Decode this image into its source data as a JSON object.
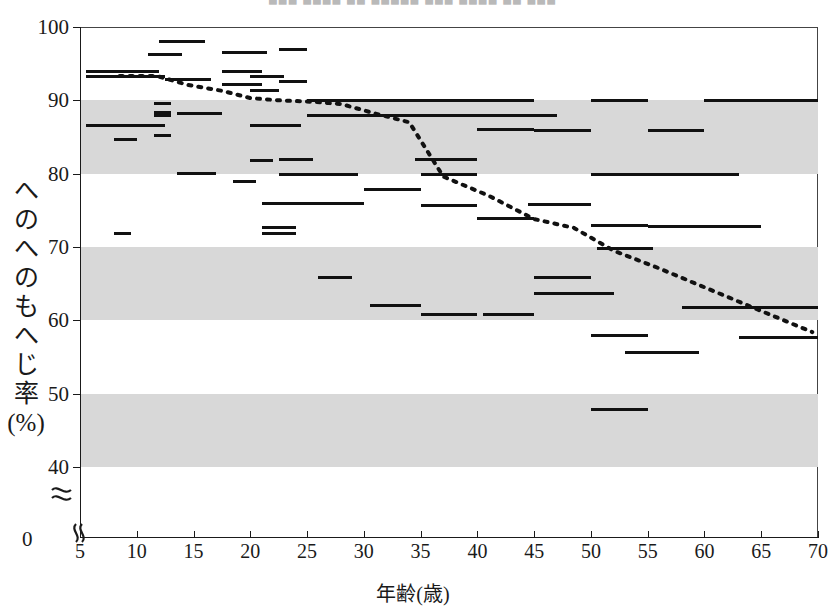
{
  "figure": {
    "top_caption": "▀▀▀  ▀▀▀▀  ▀▀  ▀▀▀▀▀  ▀▀▀  ▀▀▀▀  ▀▀  ▀▀▀",
    "x_axis_title": "年齢(歳)",
    "y_axis_title_lines": [
      "へ",
      "の",
      "へ",
      "の",
      "も",
      "へ",
      "じ",
      "率",
      "(%)"
    ],
    "zero_label": "0",
    "accent_color": "#111111",
    "band_color": "#d8d8d8",
    "axis_color": "#1a1a1a"
  },
  "chart_data": {
    "type": "scatter",
    "title": "",
    "subtitle": "",
    "xlabel": "年齢(歳)",
    "ylabel": "へのへのもへじ率(%)",
    "xlim": [
      5,
      70
    ],
    "ylim": [
      40,
      100
    ],
    "y_axis_break": true,
    "y_axis_break_note": "axis broken between 40 and 0",
    "xticks": [
      5,
      10,
      15,
      20,
      25,
      30,
      35,
      40,
      45,
      50,
      55,
      60,
      65,
      70
    ],
    "yticks": [
      0,
      40,
      50,
      60,
      70,
      80,
      90,
      100
    ],
    "grid": false,
    "legend": "none",
    "shaded_bands": [
      {
        "from": 80,
        "to": 90
      },
      {
        "from": 60,
        "to": 70
      },
      {
        "from": 40,
        "to": 50
      }
    ],
    "series": [
      {
        "name": "age-group ranges",
        "style": "horizontal-segment",
        "segments": [
          {
            "x0": 5.5,
            "x1": 12.0,
            "y": 93.3
          },
          {
            "x0": 5.5,
            "x1": 12.0,
            "y": 94.0
          },
          {
            "x0": 5.5,
            "x1": 12.5,
            "y": 86.6
          },
          {
            "x0": 8.0,
            "x1": 10.0,
            "y": 84.7
          },
          {
            "x0": 8.0,
            "x1": 9.5,
            "y": 71.8
          },
          {
            "x0": 11.0,
            "x1": 12.5,
            "y": 93.3
          },
          {
            "x0": 11.0,
            "x1": 14.0,
            "y": 96.2
          },
          {
            "x0": 12.0,
            "x1": 16.0,
            "y": 98.0
          },
          {
            "x0": 11.5,
            "x1": 13.0,
            "y": 89.6
          },
          {
            "x0": 11.5,
            "x1": 13.0,
            "y": 88.4
          },
          {
            "x0": 11.5,
            "x1": 13.0,
            "y": 88.0
          },
          {
            "x0": 11.5,
            "x1": 13.0,
            "y": 85.2
          },
          {
            "x0": 12.5,
            "x1": 16.5,
            "y": 92.9
          },
          {
            "x0": 13.5,
            "x1": 17.5,
            "y": 88.2
          },
          {
            "x0": 13.5,
            "x1": 17.0,
            "y": 80.0
          },
          {
            "x0": 17.5,
            "x1": 21.0,
            "y": 92.2
          },
          {
            "x0": 17.5,
            "x1": 21.5,
            "y": 96.5
          },
          {
            "x0": 17.5,
            "x1": 21.0,
            "y": 94.0
          },
          {
            "x0": 18.5,
            "x1": 20.5,
            "y": 78.9
          },
          {
            "x0": 20.0,
            "x1": 23.0,
            "y": 93.3
          },
          {
            "x0": 20.0,
            "x1": 22.5,
            "y": 91.3
          },
          {
            "x0": 20.0,
            "x1": 24.5,
            "y": 86.6
          },
          {
            "x0": 20.0,
            "x1": 22.0,
            "y": 81.8
          },
          {
            "x0": 21.0,
            "x1": 25.0,
            "y": 75.9
          },
          {
            "x0": 21.0,
            "x1": 24.0,
            "y": 72.6
          },
          {
            "x0": 21.0,
            "x1": 24.0,
            "y": 71.9
          },
          {
            "x0": 22.5,
            "x1": 25.0,
            "y": 96.9
          },
          {
            "x0": 22.5,
            "x1": 25.0,
            "y": 92.6
          },
          {
            "x0": 22.5,
            "x1": 25.5,
            "y": 82.0
          },
          {
            "x0": 22.5,
            "x1": 25.0,
            "y": 79.9
          },
          {
            "x0": 25.0,
            "x1": 30.0,
            "y": 90.0
          },
          {
            "x0": 25.0,
            "x1": 30.0,
            "y": 88.0
          },
          {
            "x0": 25.0,
            "x1": 29.5,
            "y": 79.9
          },
          {
            "x0": 25.0,
            "x1": 30.0,
            "y": 75.9
          },
          {
            "x0": 26.0,
            "x1": 29.0,
            "y": 65.9
          },
          {
            "x0": 30.0,
            "x1": 40.0,
            "y": 90.0
          },
          {
            "x0": 30.0,
            "x1": 40.0,
            "y": 88.0
          },
          {
            "x0": 30.0,
            "x1": 35.0,
            "y": 77.9
          },
          {
            "x0": 30.5,
            "x1": 35.0,
            "y": 62.0
          },
          {
            "x0": 34.5,
            "x1": 40.0,
            "y": 82.0
          },
          {
            "x0": 35.0,
            "x1": 40.0,
            "y": 79.9
          },
          {
            "x0": 35.0,
            "x1": 40.0,
            "y": 75.7
          },
          {
            "x0": 35.0,
            "x1": 40.0,
            "y": 60.8
          },
          {
            "x0": 40.0,
            "x1": 45.0,
            "y": 90.0
          },
          {
            "x0": 40.0,
            "x1": 47.0,
            "y": 88.0
          },
          {
            "x0": 40.0,
            "x1": 45.0,
            "y": 86.0
          },
          {
            "x0": 40.0,
            "x1": 45.0,
            "y": 73.9
          },
          {
            "x0": 40.5,
            "x1": 45.0,
            "y": 60.8
          },
          {
            "x0": 44.5,
            "x1": 50.0,
            "y": 75.8
          },
          {
            "x0": 45.0,
            "x1": 50.0,
            "y": 85.9
          },
          {
            "x0": 45.0,
            "x1": 50.0,
            "y": 65.8
          },
          {
            "x0": 45.0,
            "x1": 50.0,
            "y": 63.7
          },
          {
            "x0": 46.0,
            "x1": 52.0,
            "y": 63.7
          },
          {
            "x0": 50.0,
            "x1": 55.0,
            "y": 90.0
          },
          {
            "x0": 50.0,
            "x1": 55.0,
            "y": 79.9
          },
          {
            "x0": 50.0,
            "x1": 55.0,
            "y": 73.0
          },
          {
            "x0": 50.5,
            "x1": 55.5,
            "y": 69.8
          },
          {
            "x0": 50.0,
            "x1": 55.0,
            "y": 57.9
          },
          {
            "x0": 50.0,
            "x1": 55.0,
            "y": 47.8
          },
          {
            "x0": 53.0,
            "x1": 59.5,
            "y": 55.6
          },
          {
            "x0": 55.0,
            "x1": 60.0,
            "y": 85.9
          },
          {
            "x0": 55.0,
            "x1": 63.0,
            "y": 79.9
          },
          {
            "x0": 55.0,
            "x1": 65.0,
            "y": 72.8
          },
          {
            "x0": 58.0,
            "x1": 64.0,
            "y": 61.8
          },
          {
            "x0": 60.0,
            "x1": 70.0,
            "y": 90.0
          },
          {
            "x0": 61.0,
            "x1": 70.0,
            "y": 61.8
          },
          {
            "x0": 63.0,
            "x1": 70.0,
            "y": 57.6
          }
        ]
      },
      {
        "name": "trend",
        "style": "dotted-line",
        "points": [
          {
            "x": 8.5,
            "y": 93.3
          },
          {
            "x": 11.8,
            "y": 93.3
          },
          {
            "x": 14.5,
            "y": 92.1
          },
          {
            "x": 17.5,
            "y": 91.3
          },
          {
            "x": 20.0,
            "y": 90.3
          },
          {
            "x": 22.5,
            "y": 90.0
          },
          {
            "x": 25.5,
            "y": 89.8
          },
          {
            "x": 28.0,
            "y": 89.5
          },
          {
            "x": 31.0,
            "y": 88.2
          },
          {
            "x": 34.0,
            "y": 87.0
          },
          {
            "x": 37.0,
            "y": 79.6
          },
          {
            "x": 41.0,
            "y": 77.0
          },
          {
            "x": 45.0,
            "y": 73.8
          },
          {
            "x": 48.5,
            "y": 72.6
          },
          {
            "x": 52.0,
            "y": 69.5
          },
          {
            "x": 56.0,
            "y": 67.1
          },
          {
            "x": 60.0,
            "y": 64.5
          },
          {
            "x": 64.5,
            "y": 61.6
          },
          {
            "x": 69.5,
            "y": 58.4
          }
        ]
      }
    ]
  }
}
